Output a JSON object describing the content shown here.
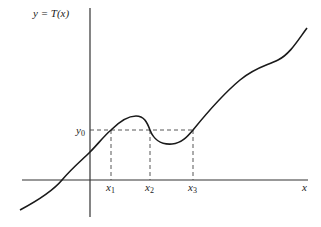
{
  "diagram": {
    "title_label": "y = T(x)",
    "x_axis_label": "x",
    "level_label": "y",
    "level_subscript": "0",
    "root_labels": [
      {
        "base": "x",
        "sub": "1"
      },
      {
        "base": "x",
        "sub": "2"
      },
      {
        "base": "x",
        "sub": "3"
      }
    ],
    "colors": {
      "curve": "#1a1a1a",
      "axes": "#333333",
      "dashed": "#444444",
      "background": "#ffffff"
    }
  }
}
